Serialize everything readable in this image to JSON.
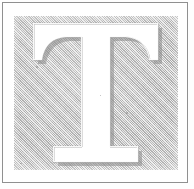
{
  "document": {
    "type": "scanned-page-fragment",
    "title": "Drop cap initial letter",
    "letter": "T",
    "alt_text": "Ornamental white serif capital letter T on a gray hatched square"
  },
  "frame": {
    "outer_rule_color": "#8e8e8e",
    "paper_color": "#ffffff",
    "outer_rule_label": "page-border"
  },
  "panel": {
    "label": "hatched-background-panel",
    "fill_color": "#c9c9c9",
    "pattern": "diagonal-hatch-dither",
    "hatch_angle_degrees": 45
  },
  "glyph": {
    "character": "T",
    "style": "serif-capital",
    "fill_color": "#ffffff",
    "outline_color": "#b4b4b4",
    "shadow_color": "#8a8a8a",
    "has_bracket_serifs": true,
    "has_drop_shadow": true
  },
  "artifacts": {
    "specks_label": "scan-speck"
  }
}
